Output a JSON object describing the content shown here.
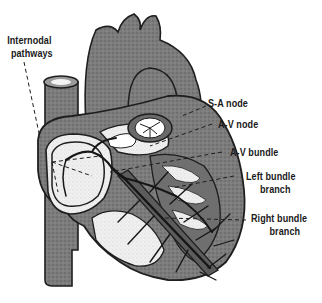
{
  "figure": {
    "colors": {
      "tissue": "#7a7a7a",
      "tissue_dark": "#5e5e5e",
      "chamber": "#ececec",
      "outline": "#1e1e1e",
      "label": "#1a1a1a",
      "background": "#ffffff"
    }
  },
  "labels": {
    "internodal": {
      "line1": "Internodal",
      "line2": "pathways"
    },
    "sa_node": "S-A node",
    "av_node": "A-V node",
    "av_bundle": "A-V bundle",
    "left_bundle": {
      "line1": "Left bundle",
      "line2": "branch"
    },
    "right_bundle": {
      "line1": "Right bundle",
      "line2": "branch"
    }
  }
}
